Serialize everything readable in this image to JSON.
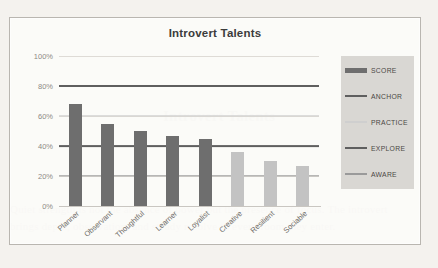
{
  "background_text": {
    "line1": "",
    "heading": "Introvert Talents",
    "body": "Quiet strength is not the absence of power but the presence of focus. The introvert\nbrings depth, observation, and steady resolve to every room they enter."
  },
  "chart_data": {
    "type": "bar",
    "title": "Introvert Talents",
    "xlabel": "",
    "ylabel": "",
    "ylim": [
      0,
      100
    ],
    "yticks": [
      "0%",
      "20%",
      "40%",
      "60%",
      "80%",
      "100%"
    ],
    "ytick_values": [
      0,
      20,
      40,
      60,
      80,
      100
    ],
    "grid": true,
    "legend_position": "right",
    "categories": [
      "Planner",
      "Observant",
      "Thoughtful",
      "Learner",
      "Loyalist",
      "Creative",
      "Resilient",
      "Sociable"
    ],
    "series": [
      {
        "name": "SCORE",
        "type": "bar",
        "values": [
          68,
          55,
          50,
          47,
          45,
          36,
          30,
          27
        ],
        "colors": [
          "#6e6e6e",
          "#6e6e6e",
          "#6e6e6e",
          "#6e6e6e",
          "#6e6e6e",
          "#c3c3c3",
          "#c3c3c3",
          "#c3c3c3"
        ]
      },
      {
        "name": "ANCHOR",
        "type": "hline",
        "value": 80,
        "color": "#5f5f5f",
        "width": 2.0
      },
      {
        "name": "PRACTICE",
        "type": "hline",
        "value": 60,
        "color": "#cfcfcf",
        "width": 1.4
      },
      {
        "name": "EXPLORE",
        "type": "hline",
        "value": 40,
        "color": "#5f5f5f",
        "width": 1.8
      },
      {
        "name": "AWARE",
        "type": "hline",
        "value": 20,
        "color": "#9a9a9a",
        "width": 1.4
      }
    ]
  },
  "legend": {
    "items": [
      {
        "label": "SCORE",
        "color": "#6e6e6e",
        "style": "block"
      },
      {
        "label": "ANCHOR",
        "color": "#5f5f5f",
        "style": "line-thick"
      },
      {
        "label": "PRACTICE",
        "color": "#cfcfcf",
        "style": "line-thin"
      },
      {
        "label": "EXPLORE",
        "color": "#5f5f5f",
        "style": "line-thick"
      },
      {
        "label": "AWARE",
        "color": "#9a9a9a",
        "style": "line-thin"
      }
    ],
    "background": "#d9d7d3"
  },
  "colors": {
    "score_dark": "#6e6e6e",
    "score_light": "#c3c3c3",
    "gridline": "#dedbd6",
    "frame": "#b9b6b0",
    "page": "#f4f2ee"
  }
}
